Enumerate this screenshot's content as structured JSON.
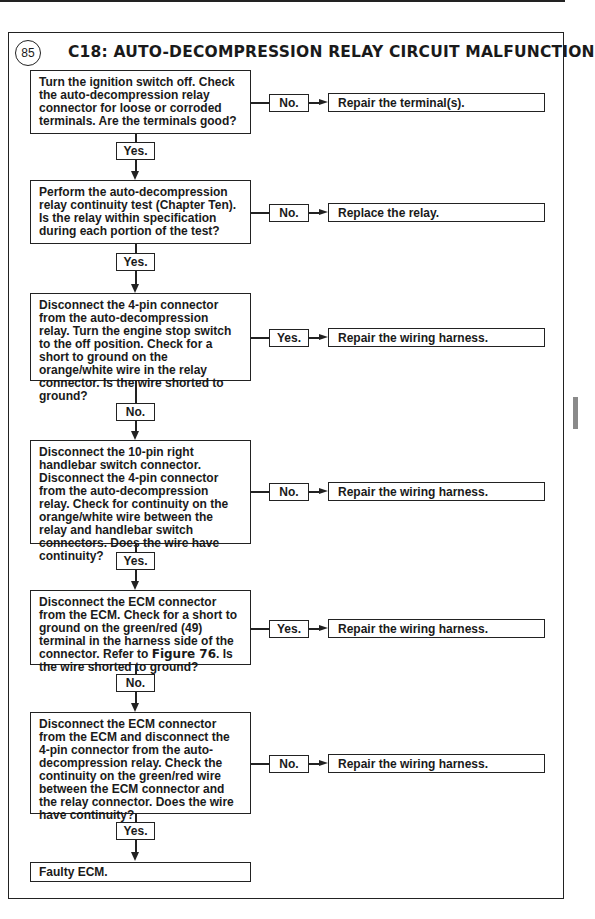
{
  "figure": {
    "number": "85",
    "title": "C18: AUTO-DECOMPRESSION RELAY CIRCUIT MALFUNCTION"
  },
  "steps": [
    {
      "text": "Turn the ignition switch off. Check the auto-decompression relay connector for loose or corroded terminals. Are the terminals good?",
      "side_label": "No.",
      "side_result": "Repair the terminal(s).",
      "down_label": "Yes."
    },
    {
      "text": "Perform the auto-decompression relay continuity test (Chapter Ten). Is the relay within specification during each portion of the test?",
      "side_label": "No.",
      "side_result": "Replace the relay.",
      "down_label": "Yes."
    },
    {
      "text": "Disconnect the 4-pin connector from the auto-decompression relay. Turn the engine stop switch to the off position. Check for a short to ground on the orange/white wire in the relay connector. Is the wire shorted to ground?",
      "side_label": "Yes.",
      "side_result": "Repair the wiring harness.",
      "down_label": "No."
    },
    {
      "text": "Disconnect the 10-pin right handlebar switch connector. Disconnect the 4-pin connector from the auto-decompression relay. Check for continuity on the orange/white wire between the relay and handlebar switch connectors. Does the wire have continuity?",
      "side_label": "No.",
      "side_result": "Repair the wiring harness.",
      "down_label": "Yes."
    },
    {
      "text_before": "Disconnect the ECM connector from the ECM. Check for a short to ground on the green/red (49) terminal in the harness side of the connector. Refer to ",
      "text_ref": "Figure 76",
      "text_after": ". Is the wire shorted to ground?",
      "side_label": "Yes.",
      "side_result": "Repair the wiring harness.",
      "down_label": "No."
    },
    {
      "text": "Disconnect the ECM connector from the ECM and disconnect the 4-pin connector from the auto-decompression relay. Check the continuity on the green/red wire between the ECM connector and the relay connector. Does the wire have continuity?",
      "side_label": "No.",
      "side_result": "Repair the wiring harness.",
      "down_label": "Yes."
    }
  ],
  "final_result": "Faulty ECM."
}
